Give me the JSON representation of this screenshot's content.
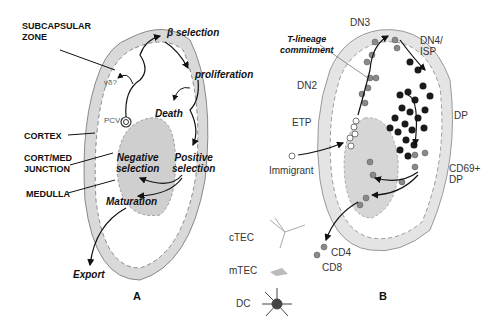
{
  "panel_a": {
    "letter": "A",
    "region_labels": {
      "subcapsular": "SUBCAPSULAR\nZONE",
      "cortex": "CORTEX",
      "cort_med": "CORT/MED\nJUNCTION",
      "medulla": "MEDULLA"
    },
    "process_labels": {
      "beta_selection": "β selection",
      "proliferation": "proliferation",
      "death": "Death",
      "negative_selection": "Negative\nselection",
      "positive_selection": "Positive\nselection",
      "maturation": "Maturation",
      "export": "Export",
      "gamma_delta": "γδ?",
      "pcv": "PCV"
    }
  },
  "panel_b": {
    "letter": "B",
    "stage_labels": {
      "dn3": "DN3",
      "dn4_isp": "DN4/\nISP",
      "t_lineage": "T-lineage\ncommitment",
      "dn2": "DN2",
      "etp": "ETP",
      "dp": "DP",
      "immigrant": "Immigrant",
      "cd69_dp": "CD69+\nDP",
      "cd4": "CD4",
      "cd8": "CD8"
    },
    "legend": [
      {
        "label": "cTEC",
        "icon": "ctec-cell-icon"
      },
      {
        "label": "mTEC",
        "icon": "mtec-cell-icon"
      },
      {
        "label": "DC",
        "icon": "dendritic-cell-icon"
      }
    ]
  },
  "colors": {
    "capsule_fill": "#d9d9d9",
    "medulla_fill": "#cfcfcf",
    "outline": "#888888",
    "cell_dark": "#1a1a1a",
    "cell_gray": "#8a8a8a"
  }
}
